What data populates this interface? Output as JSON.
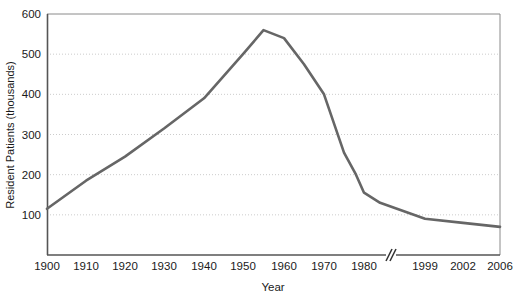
{
  "chart_data": {
    "type": "line",
    "title": "",
    "xlabel": "Year",
    "ylabel": "Resident Patients (thousands)",
    "ylim": [
      0,
      600
    ],
    "yticks": [
      100,
      200,
      300,
      400,
      500,
      600
    ],
    "grid": true,
    "grid_style": "dotted-horizontal",
    "legend": "none",
    "axis_break": {
      "present": true,
      "symbol": "//",
      "after_tick": "1980",
      "before_tick": "1999"
    },
    "xticks": [
      "1900",
      "1910",
      "1920",
      "1930",
      "1940",
      "1950",
      "1960",
      "1970",
      "1980",
      "1999",
      "2002",
      "2006"
    ],
    "x": [
      1900,
      1910,
      1920,
      1930,
      1940,
      1950,
      1955,
      1960,
      1965,
      1970,
      1975,
      1978,
      1980,
      1985,
      1999,
      2002,
      2006
    ],
    "values": [
      115,
      185,
      245,
      315,
      390,
      500,
      560,
      540,
      475,
      400,
      255,
      200,
      155,
      130,
      90,
      80,
      70
    ],
    "series": [
      {
        "name": "Resident Patients",
        "color": "#666666",
        "values": [
          115,
          185,
          245,
          315,
          390,
          500,
          560,
          540,
          475,
          400,
          255,
          200,
          155,
          130,
          90,
          80,
          70
        ]
      }
    ],
    "annotations": []
  },
  "colors": {
    "line": "#6b6b6b",
    "axis": "#555555",
    "grid": "#cccccc",
    "text": "#1a1a1a",
    "background": "#ffffff"
  }
}
